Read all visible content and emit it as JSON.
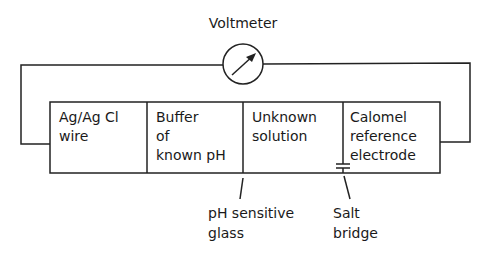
{
  "diagram": {
    "voltmeter_label": "Voltmeter",
    "cells": [
      {
        "lines": [
          "Ag/Ag Cl",
          "wire"
        ]
      },
      {
        "lines": [
          "Buffer",
          "of",
          "known pH"
        ]
      },
      {
        "lines": [
          "Unknown",
          "solution"
        ]
      },
      {
        "lines": [
          "Calomel",
          "reference",
          "electrode"
        ]
      }
    ],
    "callouts": {
      "glass": [
        "pH sensitive",
        "glass"
      ],
      "salt_bridge": [
        "Salt",
        "bridge"
      ]
    },
    "colors": {
      "line": "#222222",
      "background": "#ffffff"
    }
  }
}
